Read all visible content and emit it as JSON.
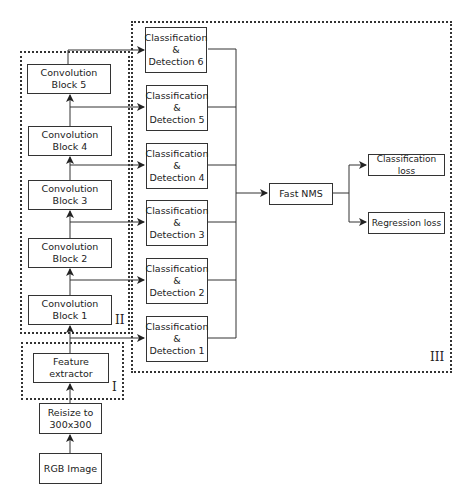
{
  "groups": {
    "feature_extractor_group": "I",
    "convolution_group": "II",
    "detection_group": "III"
  },
  "input": {
    "rgb_image": "RGB Image",
    "resize_line1": "Reisize to",
    "resize_line2": "300x300"
  },
  "feature_extractor": "Feature extractor",
  "conv_blocks": [
    "Convolution Block 1",
    "Convolution Block 2",
    "Convolution Block 3",
    "Convolution Block 4",
    "Convolution Block 5"
  ],
  "detections": [
    {
      "line1": "Classification",
      "line2": "&",
      "line3": "Detection 1"
    },
    {
      "line1": "Classification",
      "line2": "&",
      "line3": "Detection 2"
    },
    {
      "line1": "Classification",
      "line2": "&",
      "line3": "Detection 3"
    },
    {
      "line1": "Classification",
      "line2": "&",
      "line3": "Detection 4"
    },
    {
      "line1": "Classification",
      "line2": "&",
      "line3": "Detection 5"
    },
    {
      "line1": "Classification",
      "line2": "&",
      "line3": "Detection 6"
    }
  ],
  "fast_nms": "Fast NMS",
  "losses": {
    "classification": "Classification loss",
    "regression": "Regression loss"
  }
}
